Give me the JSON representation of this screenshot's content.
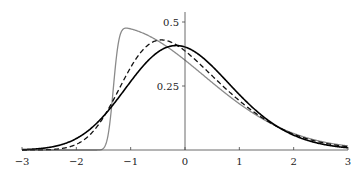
{
  "chart_data": {
    "type": "line",
    "title": "",
    "xlabel": "",
    "ylabel": "",
    "xlim": [
      -3,
      3
    ],
    "ylim": [
      0,
      0.55
    ],
    "grid": false,
    "legend": null,
    "x_ticks": [
      -3,
      -2,
      -1,
      0,
      1,
      2,
      3
    ],
    "x_tick_labels": [
      "−3",
      "−2",
      "−1",
      "0",
      "1",
      "2",
      "3"
    ],
    "y_ticks": [
      0.25,
      0.5
    ],
    "y_tick_labels": [
      "0.25",
      "0.5"
    ],
    "series": [
      {
        "name": "gray-solid",
        "style": "solid",
        "color": "#8a8a8a",
        "width": 1.3,
        "skew_alpha": 20,
        "peak": {
          "x": -0.74,
          "y": 0.52
        },
        "x": [
          -1.42,
          -1.3,
          -1.2,
          -1.0,
          -0.74,
          -0.5,
          0.0,
          0.5,
          1.0,
          1.5,
          2.0,
          2.5,
          3.0
        ],
        "values": [
          0.0,
          0.2,
          0.36,
          0.48,
          0.52,
          0.5,
          0.38,
          0.27,
          0.17,
          0.1,
          0.05,
          0.025,
          0.01
        ]
      },
      {
        "name": "black-dashed",
        "style": "dashed",
        "color": "#111111",
        "width": 1.3,
        "skew_alpha": 3,
        "peak": {
          "x": -0.46,
          "y": 0.445
        },
        "x": [
          -2.2,
          -2.0,
          -1.5,
          -1.0,
          -0.46,
          0.0,
          0.5,
          1.0,
          1.5,
          2.0,
          2.5,
          3.0
        ],
        "values": [
          0.0,
          0.01,
          0.1,
          0.33,
          0.445,
          0.4,
          0.3,
          0.19,
          0.11,
          0.05,
          0.02,
          0.008
        ]
      },
      {
        "name": "black-solid",
        "style": "solid",
        "color": "#000000",
        "width": 1.6,
        "skew_alpha": 1.5,
        "peak": {
          "x": -0.18,
          "y": 0.4
        },
        "x": [
          -3.0,
          -2.5,
          -2.0,
          -1.5,
          -1.0,
          -0.18,
          0.5,
          1.0,
          1.5,
          2.0,
          2.5,
          3.0
        ],
        "values": [
          0.002,
          0.015,
          0.05,
          0.13,
          0.26,
          0.4,
          0.34,
          0.22,
          0.12,
          0.05,
          0.018,
          0.006
        ]
      }
    ]
  },
  "layout": {
    "x_min_px": 22,
    "x_max_px": 348,
    "y_zero_px": 150,
    "y_scale_px": 256,
    "y_axis_top_px": 12
  }
}
